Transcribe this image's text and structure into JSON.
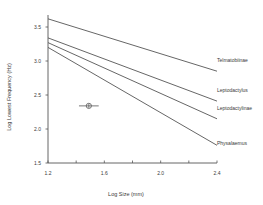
{
  "chart_data": {
    "type": "line",
    "title": "",
    "xlabel": "Log Size (mm)",
    "ylabel": "Log Lowest Frequency (Hz)",
    "xlim": [
      1.2,
      2.4
    ],
    "ylim": [
      1.5,
      3.72
    ],
    "x_ticks": [
      1.2,
      1.4,
      1.6,
      1.8,
      2.0,
      2.2,
      2.4
    ],
    "x_tick_labels": [
      "1.2",
      "",
      "1.6",
      "",
      "2.0",
      "",
      "2.4"
    ],
    "y_ticks": [
      1.5,
      2.0,
      2.5,
      3.0,
      3.5
    ],
    "y_tick_labels": [
      "1.5",
      "2.0",
      "2.5",
      "3.0",
      "3.5"
    ],
    "grid": false,
    "legend": "labels at right end of each line",
    "series": [
      {
        "name": "Telmatobiinae",
        "x": [
          1.2,
          2.4
        ],
        "y": [
          3.62,
          2.85
        ]
      },
      {
        "name": "Leptodactylus",
        "x": [
          1.2,
          2.4
        ],
        "y": [
          3.34,
          2.41
        ]
      },
      {
        "name": "Leptodactylinae",
        "x": [
          1.2,
          2.4
        ],
        "y": [
          3.27,
          2.15
        ]
      },
      {
        "name": "Physalaemus",
        "x": [
          1.2,
          2.4
        ],
        "y": [
          3.2,
          1.76
        ]
      }
    ],
    "points": [
      {
        "name": "observed species mean",
        "x": 1.49,
        "y": 2.34,
        "x_err": [
          1.42,
          1.56
        ],
        "y_err": [
          2.31,
          2.37
        ]
      }
    ]
  }
}
